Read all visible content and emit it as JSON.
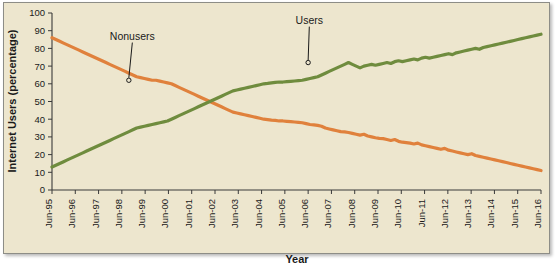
{
  "chart_data": {
    "type": "line",
    "title": "",
    "xlabel": "Year",
    "ylabel": "Internet Users (percentage)",
    "xlim": [
      0,
      21
    ],
    "ylim": [
      0,
      100
    ],
    "ytick_step": 10,
    "grid": false,
    "legend_position": "none",
    "background_color": "#EDE6CE",
    "categories": [
      "Jun-95",
      "Jun-96",
      "Jun-97",
      "Jun-98",
      "Jun-99",
      "Jun-00",
      "Jun-01",
      "Jun-02",
      "Jun-03",
      "Jun-04",
      "Jun-05",
      "Jun-06",
      "Jun-07",
      "Jun-08",
      "Jun-09",
      "Jun-10",
      "Jun-11",
      "Jun-12",
      "Jun-13",
      "Jun-14",
      "Jun-15",
      "Jun-16"
    ],
    "yticks": [
      0,
      10,
      20,
      30,
      40,
      50,
      60,
      70,
      80,
      90,
      100
    ],
    "series": [
      {
        "name": "Nonusers",
        "color": "#E0813C",
        "values": [
          86,
          78,
          70,
          64,
          62,
          58,
          50,
          44,
          40,
          39,
          38,
          36,
          33,
          31,
          29,
          27,
          25,
          22,
          20,
          16,
          14,
          11
        ],
        "monthly_values": [
          86,
          85,
          84,
          83,
          82,
          81,
          80,
          79,
          78,
          77,
          76,
          75,
          74,
          73,
          72,
          71,
          70,
          69,
          68,
          67,
          66,
          65,
          64,
          63.5,
          63,
          62.5,
          62,
          62,
          61.5,
          61,
          60.5,
          60,
          59,
          58,
          57,
          56,
          55,
          54,
          53,
          52,
          51,
          50,
          49,
          48,
          47,
          46,
          45,
          44,
          43.5,
          43,
          42.5,
          42,
          41.5,
          41,
          40.5,
          40,
          39.8,
          39.5,
          39.3,
          39,
          39,
          38.8,
          38.6,
          38.4,
          38.2,
          38,
          37.5,
          37,
          36.8,
          36.5,
          36,
          35,
          34.5,
          34,
          33.5,
          33,
          32.8,
          32.5,
          32,
          31.5,
          31,
          31.5,
          30.5,
          30,
          29.5,
          29.2,
          29,
          28.5,
          28,
          28.5,
          27.5,
          27,
          26.8,
          26.5,
          26,
          26.5,
          25.5,
          25,
          24.5,
          24,
          23.5,
          23,
          23.5,
          22.5,
          22,
          21.5,
          21,
          20.5,
          20,
          20.5,
          19.5,
          19,
          18.5,
          18,
          17.5,
          17,
          16.5,
          16,
          15.5,
          15,
          14.5,
          14,
          13.5,
          13,
          12.5,
          12,
          11.5,
          11
        ]
      },
      {
        "name": "Users",
        "color": "#6F8C3E",
        "values": [
          13,
          22,
          30,
          36,
          38,
          42,
          50,
          56,
          60,
          61,
          62,
          64,
          67,
          69,
          71,
          73,
          75,
          78,
          80,
          84,
          86,
          88
        ],
        "monthly_values": [
          13,
          14,
          15,
          16,
          17,
          18,
          19,
          20,
          21,
          22,
          23,
          24,
          25,
          26,
          27,
          28,
          29,
          30,
          31,
          32,
          33,
          34,
          35,
          35.5,
          36,
          36.5,
          37,
          37.5,
          38,
          38.5,
          39,
          40,
          41,
          42,
          43,
          44,
          45,
          46,
          47,
          48,
          49,
          50,
          51,
          52,
          53,
          54,
          55,
          56,
          56.5,
          57,
          57.5,
          58,
          58.5,
          59,
          59.5,
          60,
          60.2,
          60.5,
          60.8,
          61,
          61,
          61.2,
          61.4,
          61.6,
          61.8,
          62,
          62.5,
          63,
          63.5,
          64,
          65,
          66,
          67,
          68,
          69,
          70,
          71,
          72,
          71,
          70,
          69,
          70,
          70.5,
          71,
          70.5,
          71,
          71.5,
          72,
          71.5,
          72.5,
          73,
          72.5,
          73,
          73.5,
          74,
          73.5,
          74.5,
          75,
          74.5,
          75,
          75.5,
          76,
          76.5,
          77,
          76.5,
          77.5,
          78,
          78.5,
          79,
          79.5,
          80,
          79.5,
          80.5,
          81,
          81.5,
          82,
          82.5,
          83,
          83.5,
          84,
          84.5,
          85,
          85.5,
          86,
          86.5,
          87,
          87.5,
          88
        ]
      }
    ],
    "annotations": [
      {
        "label": "Nonusers",
        "series": "Nonusers",
        "point_x": 3.3,
        "point_y": 62,
        "label_x": 3.45,
        "label_y": 85
      },
      {
        "label": "Users",
        "series": "Users",
        "point_x": 11.0,
        "point_y": 72,
        "label_x": 11.05,
        "label_y": 94
      }
    ]
  }
}
